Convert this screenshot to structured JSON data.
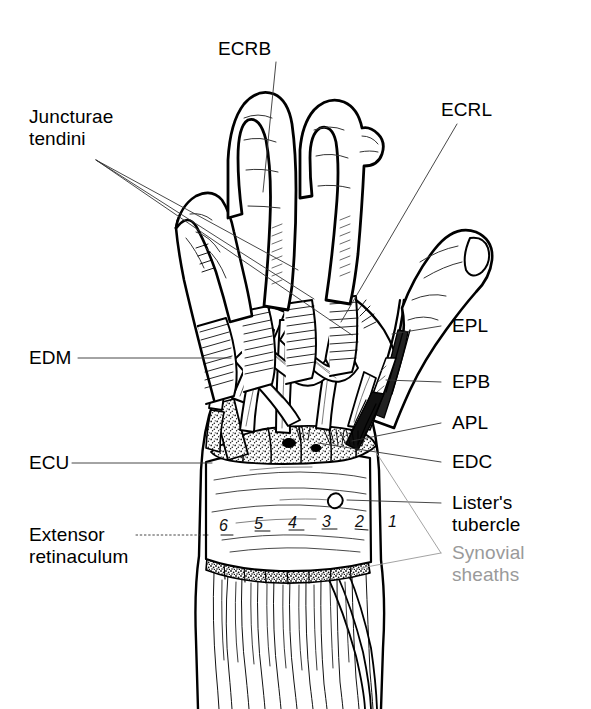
{
  "figure": {
    "background_color": "#ffffff",
    "ink_color": "#000000",
    "muted_color": "#9a9a9a",
    "width": 591,
    "height": 709
  },
  "labels": {
    "ecrb": "ECRB",
    "ecrl": "ECRL",
    "juncturae_line1": "Juncturae",
    "juncturae_line2": "tendini",
    "edm": "EDM",
    "ecu": "ECU",
    "extensor_line1": "Extensor",
    "extensor_line2": "retinaculum",
    "epl": "EPL",
    "epb": "EPB",
    "apl": "APL",
    "edc": "EDC",
    "listers_line1": "Lister's",
    "listers_line2": "tubercle",
    "synovial_line1": "Synovial",
    "synovial_line2": "sheaths"
  },
  "compartments": {
    "caption": "Extensor compartments of the wrist",
    "numbers": [
      "6",
      "5",
      "4",
      "3",
      "2",
      "1"
    ]
  },
  "structures": {
    "listers_tubercle": "small bony prominence on dorsal radius",
    "retinaculum": "extensor retinaculum band",
    "synovial_sheaths": "stippled sheath regions above and below retinaculum"
  }
}
